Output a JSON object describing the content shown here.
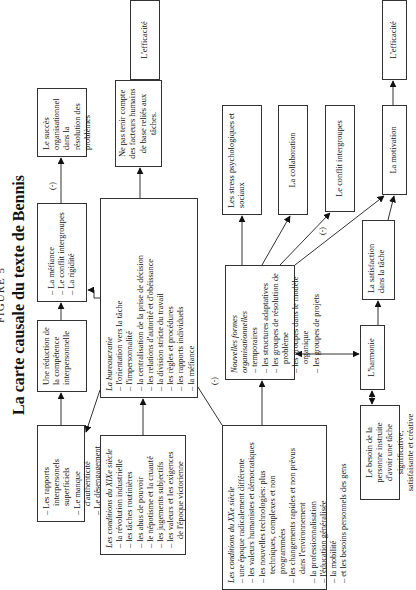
{
  "figure": {
    "label": "FIGURE 5",
    "title": "La carte causale du texte de Bennis"
  },
  "nodes": {
    "rapports": {
      "items": [
        "Les rapports interpersonels superficiels",
        "Le manque d'authenticité",
        "Le désengagement"
      ]
    },
    "reduction": {
      "text": "Une réduction de la compétence interpersonnelle"
    },
    "mefiance": {
      "items": [
        "La méfiance",
        "Le conflit intergroupes",
        "La rigidité"
      ]
    },
    "succes": {
      "text": "Le succès organisationnel dans la résolution des problèmes"
    },
    "bureaucratie": {
      "heading": "La bureaucratie",
      "items": [
        "l'orientation vers la tâche",
        "l'impersonnalité",
        "la centralisation de la prise de décision",
        "les relations d'autorité et d'obéissance",
        "la division stricte du travail",
        "les règles et procédures",
        "les rapports individuels",
        "la méfiance"
      ]
    },
    "ne_pas_tenir": {
      "text": "Ne pas tenir compte des facteurs humains de base reliés aux tâches."
    },
    "efficacite_1": {
      "text": "L'efficacité"
    },
    "xix": {
      "heading": "Les conditions du XIXe siècle",
      "items": [
        "la révolution industrielle",
        "les tâches routinières",
        "les abus de pouvoir",
        "le népotisme et la cruauté",
        "les jugements subjectifs",
        "les valeurs et les exigences de l'époque victorienne"
      ]
    },
    "xx": {
      "heading": "Les conditions du XXe siècle",
      "items": [
        "une époque radicalement différente",
        "les valeurs humanistes et démocratiques",
        "les nouvelles technologies: plus techniques, complexes et non programmées",
        "les changements rapides et non prévus dans l'environnement",
        "la professionnalisation",
        "l'éducation généralisée",
        "la mobilité",
        "et les besoins personnels des gens"
      ]
    },
    "nouvelles": {
      "heading": "Nouvelles formes organisationnelles",
      "items": [
        "temporaires",
        "les structures adaptatives",
        "les groupes de résolution de problème",
        "les groupes dans le modèle organique",
        "les groupes de projets"
      ]
    },
    "stress": {
      "text": "Les stress psychologiques et sociaux"
    },
    "collaboration": {
      "text": "La collaboration"
    },
    "conflit": {
      "text": "Le conflit intergroupes"
    },
    "satisfaction": {
      "text": "La satisfaction dans la tâche"
    },
    "motivation": {
      "text": "La motivation"
    },
    "efficacite_2": {
      "text": "L'efficacité"
    },
    "harmonie": {
      "text": "L'harmonie"
    },
    "besoin": {
      "text": "Le besoin de la personne instruite d'avoir une tâche significative, satisfaisante et créative"
    }
  },
  "edge_labels": {
    "neg": "(-)"
  }
}
